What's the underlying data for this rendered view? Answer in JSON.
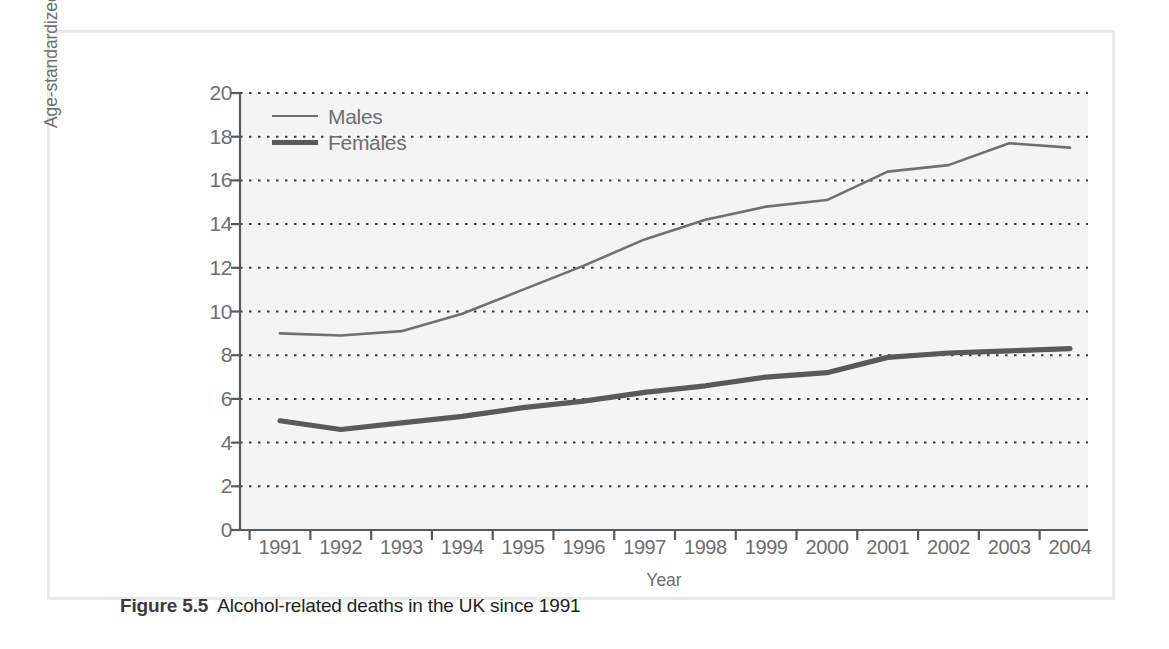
{
  "figure": {
    "caption_number": "Figure 5.5",
    "caption_text": "Alcohol-related deaths in the UK since 1991"
  },
  "legend": {
    "items": [
      {
        "label": "Males",
        "style": "thin"
      },
      {
        "label": "Females",
        "style": "thick"
      }
    ]
  },
  "colors": {
    "males_line": "#6f7072",
    "females_line": "#58595b",
    "axis": "#58595b",
    "gridline": "#3a3a3c",
    "text": "#6d6e70",
    "plot_background": "#f4f4f4",
    "frame": "#e9eaec"
  },
  "chart_data": {
    "type": "line",
    "title": "Alcohol-related deaths in the UK since 1991",
    "xlabel": "Year",
    "ylabel": "Age-standardized rate per 100,000 population",
    "categories": [
      "1991",
      "1992",
      "1993",
      "1994",
      "1995",
      "1996",
      "1997",
      "1998",
      "1999",
      "2000",
      "2001",
      "2002",
      "2003",
      "2004"
    ],
    "x": [
      1991,
      1992,
      1993,
      1994,
      1995,
      1996,
      1997,
      1998,
      1999,
      2000,
      2001,
      2002,
      2003,
      2004
    ],
    "series": [
      {
        "name": "Males",
        "values": [
          9.0,
          8.9,
          9.1,
          9.9,
          11.0,
          12.1,
          13.3,
          14.2,
          14.8,
          15.1,
          16.4,
          16.7,
          17.7,
          17.5
        ]
      },
      {
        "name": "Females",
        "values": [
          5.0,
          4.6,
          4.9,
          5.2,
          5.6,
          5.9,
          6.3,
          6.6,
          7.0,
          7.2,
          7.9,
          8.1,
          8.2,
          8.3
        ]
      }
    ],
    "ylim": [
      0,
      20
    ],
    "y_ticks": [
      0,
      2,
      4,
      6,
      8,
      10,
      12,
      14,
      16,
      18,
      20
    ],
    "grid": "horizontal-dotted",
    "legend_position": "top-left"
  }
}
